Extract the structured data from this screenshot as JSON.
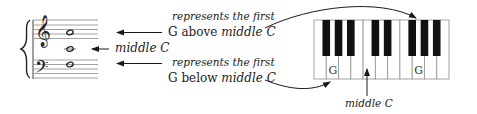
{
  "staff": {
    "treble_clef": "treble-clef",
    "bass_clef": "bass-clef",
    "notes": [
      {
        "name": "G above middle C",
        "y": 33
      },
      {
        "name": "middle C",
        "y": 49
      },
      {
        "name": "G below middle C",
        "y": 64
      }
    ]
  },
  "labels": {
    "g_above": {
      "line1": "represents the first",
      "line2_a": "G above ",
      "line2_b": "middle C"
    },
    "middle_c_staff": "middle C",
    "g_below": {
      "line1": "represents the first",
      "line2_a": "G below ",
      "line2_b": "middle C"
    },
    "middle_c_keyboard": "middle C"
  },
  "keyboard": {
    "white_keys": [
      "F",
      "G",
      "A",
      "B",
      "C",
      "D",
      "E",
      "F",
      "G",
      "A",
      "B"
    ],
    "black_after_white_index": [
      0,
      1,
      2,
      4,
      5,
      7,
      8,
      9
    ],
    "g_label": "G",
    "g_key_indices": [
      1,
      8
    ],
    "middle_c_index": 4
  },
  "colors": {
    "ink": "#1a1a1a",
    "staff_line": "#8a8a8a",
    "key_border": "#9a9a9a",
    "black_key": "#111111"
  }
}
